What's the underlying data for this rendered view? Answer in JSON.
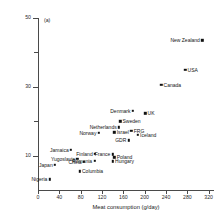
{
  "chart_data": {
    "type": "scatter",
    "title": "",
    "panel_label": "(a)",
    "xlabel": "Meat consumption (g/day)",
    "ylabel": "Annual colon cancer incidence per 100 000 women aged 35–64 (standardised for age)",
    "xlim": [
      0,
      330
    ],
    "ylim": [
      0,
      50
    ],
    "xticks": [
      0,
      40,
      80,
      120,
      160,
      200,
      240,
      280,
      320
    ],
    "xtick_labels": [
      "0",
      "40",
      "80",
      "120",
      "160",
      "200",
      "240",
      "280",
      "320"
    ],
    "yticks": [
      10,
      20,
      30,
      40,
      50
    ],
    "ytick_labels": [
      "10",
      "",
      "30",
      "",
      "50"
    ],
    "grid": false,
    "legend": false,
    "points": [
      {
        "label": "New Zealand",
        "x": 308,
        "y": 43.5,
        "label_side": "left"
      },
      {
        "label": "USA",
        "x": 276,
        "y": 35.0,
        "label_side": "right"
      },
      {
        "label": "Canada",
        "x": 231,
        "y": 30.5,
        "label_side": "right"
      },
      {
        "label": "Denmark",
        "x": 178,
        "y": 23.0,
        "label_side": "left"
      },
      {
        "label": "UK",
        "x": 201,
        "y": 22.3,
        "label_side": "right"
      },
      {
        "label": "Sweden",
        "x": 154,
        "y": 20.0,
        "label_side": "right"
      },
      {
        "label": "Netherlands",
        "x": 152,
        "y": 18.2,
        "label_side": "left"
      },
      {
        "label": "Israel",
        "x": 143,
        "y": 16.8,
        "label_side": "right"
      },
      {
        "label": "FRG",
        "x": 175,
        "y": 17.2,
        "label_side": "right"
      },
      {
        "label": "Norway",
        "x": 114,
        "y": 16.6,
        "label_side": "left"
      },
      {
        "label": "Iceland",
        "x": 187,
        "y": 16.0,
        "label_side": "right"
      },
      {
        "label": "GDR",
        "x": 170,
        "y": 14.4,
        "label_side": "left"
      },
      {
        "label": "Jamaica",
        "x": 62,
        "y": 11.6,
        "label_side": "left"
      },
      {
        "label": "Finland",
        "x": 107,
        "y": 10.6,
        "label_side": "left"
      },
      {
        "label": "France",
        "x": 140,
        "y": 10.4,
        "label_side": "left"
      },
      {
        "label": "Poland",
        "x": 143,
        "y": 9.5,
        "label_side": "right"
      },
      {
        "label": "Yugoslavia",
        "x": 74,
        "y": 9.0,
        "label_side": "left"
      },
      {
        "label": "Romania",
        "x": 106,
        "y": 8.4,
        "label_side": "left"
      },
      {
        "label": "Hungary",
        "x": 140,
        "y": 8.3,
        "label_side": "right"
      },
      {
        "label": "China",
        "x": 86,
        "y": 8.2,
        "label_side": "left"
      },
      {
        "label": "Japan",
        "x": 32,
        "y": 7.3,
        "label_side": "left"
      },
      {
        "label": "Columbia",
        "x": 78,
        "y": 5.4,
        "label_side": "right"
      },
      {
        "label": "Nigeria",
        "x": 22,
        "y": 3.1,
        "label_side": "left"
      }
    ]
  }
}
